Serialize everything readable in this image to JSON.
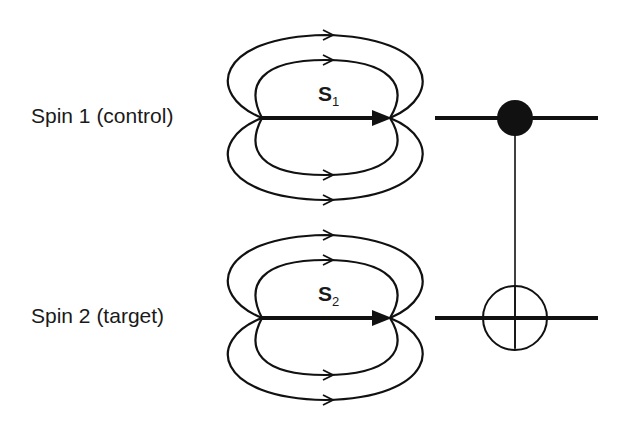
{
  "diagram": {
    "type": "cnot-gate-spin-dipole",
    "spins": [
      {
        "label": "Spin 1 (control)",
        "vector_symbol": "S",
        "vector_subscript": "1",
        "role": "control"
      },
      {
        "label": "Spin 2 (target)",
        "vector_symbol": "S",
        "vector_subscript": "2",
        "role": "target"
      }
    ],
    "gate": {
      "control_symbol": "filled-dot-icon",
      "target_symbol": "oplus-icon"
    },
    "colors": {
      "stroke": "#111111",
      "background": "#ffffff"
    }
  }
}
